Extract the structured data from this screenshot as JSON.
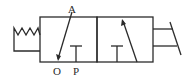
{
  "diagram": {
    "type": "pneumatic 3/2 directional control valve symbol",
    "ports": {
      "a": "A",
      "o": "O",
      "p": "P"
    },
    "left_actuator": "spring",
    "right_actuator": "push/lever actuator",
    "positions": [
      {
        "name": "left-position",
        "flow": "A to O (exhaust)",
        "blocked": "P"
      },
      {
        "name": "right-position",
        "flow": "P to A",
        "blocked": "O"
      }
    ],
    "colors": {
      "line": "#2b2b2b",
      "background": "#ffffff"
    }
  }
}
